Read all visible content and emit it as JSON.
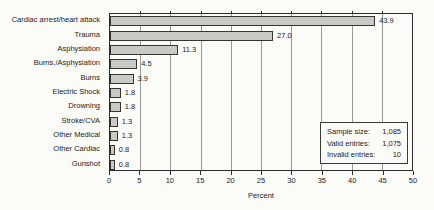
{
  "chart_data": {
    "type": "bar",
    "orientation": "horizontal",
    "title": "",
    "xlabel": "Percent",
    "xlim": [
      0,
      50
    ],
    "xticks": [
      0,
      5,
      10,
      15,
      20,
      25,
      30,
      35,
      40,
      45,
      50
    ],
    "grid": true,
    "categories": [
      "Cardiac arrest/heart attack",
      "Trauma",
      "Asphysiation",
      "Burns,/Asphysiation",
      "Burns",
      "Electric Shock",
      "Drowning",
      "Stroke/CVA",
      "Other Medical",
      "Other Cardiac",
      "Gunshot"
    ],
    "values": [
      43.9,
      27.0,
      11.3,
      4.5,
      3.9,
      1.8,
      1.8,
      1.3,
      1.3,
      0.8,
      0.8
    ],
    "value_labels": [
      "43.9",
      "27.0",
      "11.3",
      "4.5",
      "3.9",
      "1.8",
      "1.8",
      "1.3",
      "1.3",
      "0.8",
      "0.8"
    ],
    "bar_color": "#c9c9c6",
    "bar_border_color": "#35352f",
    "gridline_color": "#9a9a98",
    "frame_color": "#2b2b2b"
  },
  "info_box": {
    "rows": [
      {
        "label": "Sample size:",
        "value": "1,085"
      },
      {
        "label": "Valid entries:",
        "value": "1,075"
      },
      {
        "label": "Invalid entries:",
        "value": "10"
      }
    ]
  }
}
